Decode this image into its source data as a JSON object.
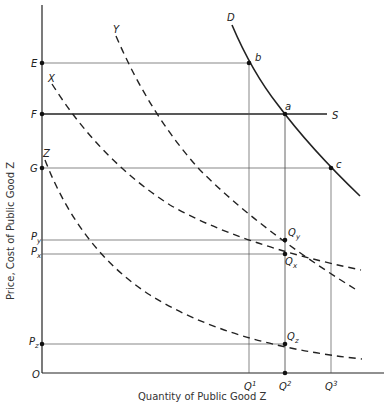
{
  "diagram": {
    "title": "",
    "xlabel": "Quantity of Public Good Z",
    "ylabel": "Price, Cost of Public Good Z",
    "origin_label": "O",
    "price_levels": [
      {
        "label": "E",
        "sub": ""
      },
      {
        "label": "F",
        "sub": ""
      },
      {
        "label": "G",
        "sub": ""
      },
      {
        "label": "P",
        "sub": "y"
      },
      {
        "label": "P",
        "sub": "x"
      },
      {
        "label": "P",
        "sub": "z"
      }
    ],
    "quantity_levels": [
      {
        "label": "Q",
        "sup": "1"
      },
      {
        "label": "Q",
        "sup": "2"
      },
      {
        "label": "Q",
        "sup": "3"
      }
    ],
    "curves": {
      "demand": {
        "label": "D",
        "style": "solid"
      },
      "supply": {
        "label": "S",
        "style": "solid, horizontal at F"
      },
      "x": {
        "label": "X",
        "style": "dashed"
      },
      "y": {
        "label": "Y",
        "style": "dashed"
      },
      "z": {
        "label": "Z",
        "style": "dashed"
      }
    },
    "points": [
      {
        "label": "b",
        "sub": ""
      },
      {
        "label": "a",
        "sub": ""
      },
      {
        "label": "c",
        "sub": ""
      },
      {
        "label": "Q",
        "sub": "y"
      },
      {
        "label": "Q",
        "sub": "x"
      },
      {
        "label": "Q",
        "sub": "z"
      }
    ],
    "colors": {
      "ink": "#222222",
      "guide": "#555555",
      "background": "#ffffff"
    }
  }
}
